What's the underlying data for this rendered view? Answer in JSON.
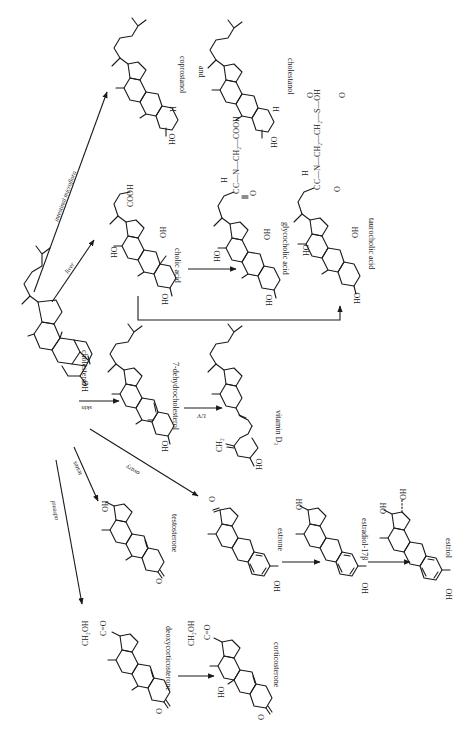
{
  "figure": {
    "orientation": "rotated 90 degrees clockwise",
    "compounds": [
      {
        "id": "cholesterol",
        "label": "cholesterol"
      },
      {
        "id": "coprostanol",
        "label": "coprostanol"
      },
      {
        "id": "and",
        "label": "and"
      },
      {
        "id": "cholestanol",
        "label": "cholestanol"
      },
      {
        "id": "cholic_acid",
        "label": "cholic acid"
      },
      {
        "id": "glycocholic_acid",
        "label": "glycocholic acid"
      },
      {
        "id": "taurocholic_acid",
        "label": "taurocholic acid"
      },
      {
        "id": "dehydrocholesterol",
        "label": "7-dehydrocholesterol"
      },
      {
        "id": "vitamin_d3",
        "label": "vitamin D₃"
      },
      {
        "id": "testosterone",
        "label": "testosterone"
      },
      {
        "id": "estrone",
        "label": "estrone"
      },
      {
        "id": "estradiol",
        "label": "estradiol-17β"
      },
      {
        "id": "estriol",
        "label": "estriol"
      },
      {
        "id": "deoxycorticosterone",
        "label": "deoxycorticosterone"
      },
      {
        "id": "corticosterone",
        "label": "corticosterone"
      }
    ],
    "arrow_labels": {
      "intestinal": "intestinal microflora",
      "liver": "liver",
      "skin": "skin",
      "uv": "UV",
      "testes": "testes",
      "ovary": "ovary",
      "adrenal": "adrenal"
    },
    "groups": {
      "ho": "HO",
      "oh": "OH",
      "h": "H",
      "o": "O",
      "cooh": "COOH",
      "ch2oh": "CH₂OH",
      "ch2": "CH₂",
      "c_eq_o": "C=O",
      "glyco_chain": "C—N—CH₂—COOH",
      "tauro_chain": "C—N—CH₂—CH₂—S—OH",
      "c": "C",
      "n": "N"
    }
  }
}
